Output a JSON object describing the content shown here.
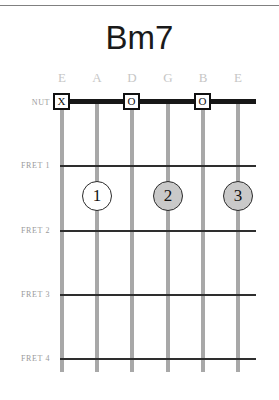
{
  "chord": {
    "title": "Bm7",
    "string_labels": [
      "E",
      "A",
      "D",
      "G",
      "B",
      "E"
    ],
    "fret_labels": [
      "NUT",
      "FRET 1",
      "FRET 2",
      "FRET 3",
      "FRET 4"
    ],
    "nut_markers": [
      {
        "string": 1,
        "symbol": "X",
        "meaning": "muted"
      },
      {
        "string": 3,
        "symbol": "O",
        "meaning": "open"
      },
      {
        "string": 5,
        "symbol": "O",
        "meaning": "open"
      }
    ],
    "finger_markers": [
      {
        "string": 2,
        "fret": 1,
        "finger": "1",
        "fill": "#ffffff"
      },
      {
        "string": 4,
        "fret": 1,
        "finger": "2",
        "fill": "#c9c9c9"
      },
      {
        "string": 6,
        "fret": 1,
        "finger": "3",
        "fill": "#c9c9c9"
      }
    ],
    "colors": {
      "title": "#1a1a1a",
      "string": "#a8a8a8",
      "nut": "#171717",
      "fret": "#2e2e2e",
      "string_label": "#c6c6c6",
      "fret_label": "#9a9a9a",
      "marker_border": "#111111",
      "dot_fill_open": "#ffffff",
      "dot_fill_pressed": "#c9c9c9"
    }
  }
}
